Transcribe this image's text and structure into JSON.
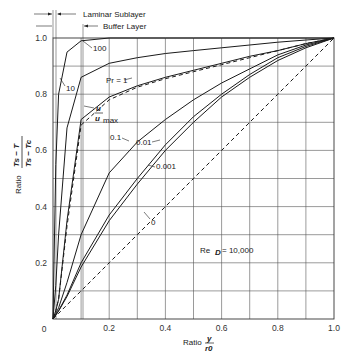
{
  "chart_data": {
    "type": "line",
    "title": "",
    "xlabel": "Ratio y/r0",
    "ylabel": "Ratio (Ts - T)/(Ts - Tc)",
    "xlim": [
      0,
      1.0
    ],
    "ylim": [
      0,
      1.0
    ],
    "grid": true,
    "x_ticks": [
      "0",
      "0.2",
      "0.4",
      "0.6",
      "0.8",
      "1.0"
    ],
    "y_ticks": [
      "0",
      "0.2",
      "0.4",
      "0.6",
      "0.8",
      "1.0"
    ],
    "x": [
      0,
      0.01,
      0.02,
      0.05,
      0.1,
      0.2,
      0.3,
      0.4,
      0.5,
      0.6,
      0.7,
      0.8,
      0.9,
      1.0
    ],
    "series": [
      {
        "name": "Pr=100",
        "style": "solid",
        "values": [
          0,
          0.55,
          0.8,
          0.95,
          0.99,
          1.0,
          1.0,
          1.0,
          1.0,
          1.0,
          1.0,
          1.0,
          1.0,
          1.0
        ]
      },
      {
        "name": "Pr=10",
        "style": "solid",
        "values": [
          0,
          0.12,
          0.3,
          0.68,
          0.86,
          0.91,
          0.93,
          0.945,
          0.955,
          0.965,
          0.975,
          0.985,
          0.993,
          1.0
        ]
      },
      {
        "name": "Pr=1",
        "style": "solid",
        "values": [
          0,
          0.03,
          0.07,
          0.35,
          0.71,
          0.79,
          0.83,
          0.86,
          0.885,
          0.91,
          0.935,
          0.955,
          0.98,
          1.0
        ]
      },
      {
        "name": "u/umax",
        "style": "dashed",
        "values": [
          0,
          0.03,
          0.07,
          0.33,
          0.69,
          0.78,
          0.825,
          0.855,
          0.88,
          0.905,
          0.93,
          0.955,
          0.98,
          1.0
        ]
      },
      {
        "name": "Pr=0.1",
        "style": "solid",
        "values": [
          0,
          0.02,
          0.04,
          0.13,
          0.3,
          0.52,
          0.63,
          0.71,
          0.78,
          0.84,
          0.89,
          0.94,
          0.975,
          1.0
        ]
      },
      {
        "name": "Pr=0.01",
        "style": "solid",
        "values": [
          0,
          0.015,
          0.03,
          0.085,
          0.2,
          0.37,
          0.5,
          0.62,
          0.72,
          0.8,
          0.87,
          0.93,
          0.97,
          1.0
        ]
      },
      {
        "name": "Pr=0.001",
        "style": "solid",
        "values": [
          0,
          0.014,
          0.028,
          0.08,
          0.185,
          0.35,
          0.48,
          0.6,
          0.7,
          0.79,
          0.86,
          0.92,
          0.965,
          1.0
        ]
      },
      {
        "name": "Pr=0",
        "style": "dashed",
        "values": [
          0,
          0.01,
          0.02,
          0.05,
          0.1,
          0.2,
          0.3,
          0.4,
          0.5,
          0.6,
          0.7,
          0.8,
          0.9,
          1.0
        ]
      }
    ],
    "annotations": {
      "laminar_sublayer": "Laminar Sublayer",
      "buffer_layer": "Buffer Layer",
      "reynolds": "Re_D = 10,000",
      "curve_labels": [
        "100",
        "10",
        "Pr = 1",
        "u/umax",
        "0.1",
        "0.01",
        "0.001",
        "0"
      ]
    }
  },
  "labels": {
    "laminar_sublayer": "Laminar Sublayer",
    "buffer_layer": "Buffer Layer",
    "pr100": "100",
    "pr10": "10",
    "pr1": "Pr = 1",
    "u_num": "u",
    "u_den": "u",
    "u_sub": "max",
    "pr01": "0.1",
    "pr001": "0.01",
    "pr0001": "0.001",
    "pr0": "0",
    "re_main": "Re",
    "re_sub": "D",
    "re_val": " = 10,000",
    "ylabel_ratio": "Ratio",
    "ylabel_num": "Ts − T",
    "ylabel_den": "Ts − Tc",
    "xlabel_ratio": "Ratio",
    "xlabel_num": "y",
    "xlabel_den": "r0",
    "x_ticks": [
      "0",
      "0.2",
      "0.4",
      "0.6",
      "0.8",
      "1.0"
    ],
    "y_ticks": [
      "0.2",
      "0.4",
      "0.6",
      "0.8",
      "1.0"
    ]
  }
}
